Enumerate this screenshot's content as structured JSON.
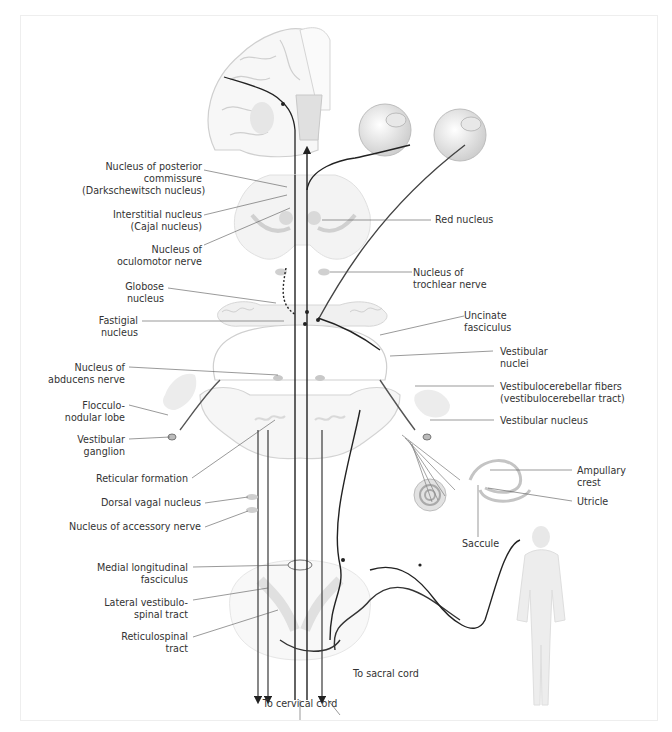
{
  "figure": {
    "colors": {
      "pathway_dark": "#222222",
      "tissue_gray": "#d9d9d9",
      "tissue_light": "#eeeeee",
      "nucleus_gray": "#bdbdbd",
      "leader_line": "#555555",
      "label_text": "#333333",
      "frame": "#eeeeee"
    }
  },
  "labels_left": {
    "posterior_commissure": [
      "Nucleus of posterior",
      "commissure",
      "(Darkschewitsch nucleus)"
    ],
    "interstitial": [
      "Interstitial nucleus",
      "(Cajal nucleus)"
    ],
    "oculomotor": [
      "Nucleus of",
      "oculomotor nerve"
    ],
    "globose": [
      "Globose",
      "nucleus"
    ],
    "fastigial": [
      "Fastigial",
      "nucleus"
    ],
    "abducens": [
      "Nucleus of",
      "abducens nerve"
    ],
    "flocculonodular": [
      "Flocculo-",
      "nodular lobe"
    ],
    "vestibular_ganglion": [
      "Vestibular",
      "ganglion"
    ],
    "reticular_formation": [
      "Reticular formation"
    ],
    "dorsal_vagal": [
      "Dorsal vagal nucleus"
    ],
    "accessory": [
      "Nucleus of accessory nerve"
    ],
    "mlf": [
      "Medial longitudinal",
      "fasciculus"
    ],
    "lateral_vestibulospinal": [
      "Lateral vestibulo-",
      "spinal tract"
    ],
    "reticulospinal": [
      "Reticulospinal",
      "tract"
    ]
  },
  "labels_right": {
    "red_nucleus": [
      "Red nucleus"
    ],
    "trochlear": [
      "Nucleus of",
      "trochlear nerve"
    ],
    "uncinate": [
      "Uncinate",
      "fasciculus"
    ],
    "vestibular_nuclei": [
      "Vestibular",
      "nuclei"
    ],
    "vestibulocerebellar": [
      "Vestibulocerebellar fibers",
      "(vestibulocerebellar tract)"
    ],
    "vestibular_nucleus": [
      "Vestibular nucleus"
    ],
    "ampullary_crest": [
      "Ampullary",
      "crest"
    ],
    "utricle": [
      "Utricle"
    ],
    "saccule": [
      "Saccule"
    ]
  },
  "labels_bottom": {
    "to_sacral": [
      "To sacral cord"
    ],
    "to_cervical": [
      "To cervical cord"
    ]
  },
  "caption": {
    "text": ""
  }
}
